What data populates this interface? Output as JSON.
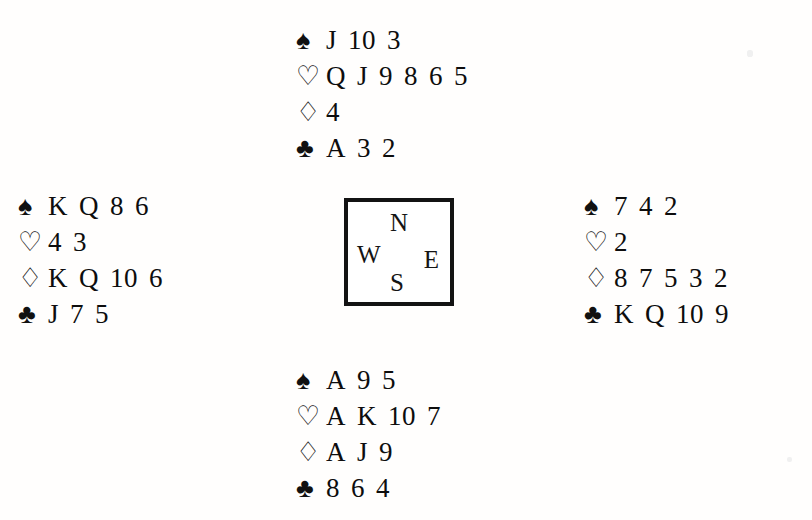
{
  "diagram": {
    "suit_order": [
      "spades",
      "hearts",
      "diamonds",
      "clubs"
    ],
    "symbols": {
      "spades": "♠",
      "hearts": "♡",
      "diamonds": "♢",
      "clubs": "♣"
    },
    "symbol_names": {
      "spades": "spade-suit-icon",
      "hearts": "heart-suit-icon",
      "diamonds": "diamond-suit-icon",
      "clubs": "club-suit-icon"
    },
    "ink_color": "#0d0d0d",
    "background_color": "#fffefd"
  },
  "compass": {
    "north": "N",
    "west": "W",
    "east": "E",
    "south": "S",
    "border_color": "#131313"
  },
  "hands": {
    "north": {
      "position": "North",
      "spades": [
        "J",
        "10",
        "3"
      ],
      "hearts": [
        "Q",
        "J",
        "9",
        "8",
        "6",
        "5"
      ],
      "diamonds": [
        "4"
      ],
      "clubs": [
        "A",
        "3",
        "2"
      ]
    },
    "west": {
      "position": "West",
      "spades": [
        "K",
        "Q",
        "8",
        "6"
      ],
      "hearts": [
        "4",
        "3"
      ],
      "diamonds": [
        "K",
        "Q",
        "10",
        "6"
      ],
      "clubs": [
        "J",
        "7",
        "5"
      ]
    },
    "east": {
      "position": "East",
      "spades": [
        "7",
        "4",
        "2"
      ],
      "hearts": [
        "2"
      ],
      "diamonds": [
        "8",
        "7",
        "5",
        "3",
        "2"
      ],
      "clubs": [
        "K",
        "Q",
        "10",
        "9"
      ]
    },
    "south": {
      "position": "South",
      "spades": [
        "A",
        "9",
        "5"
      ],
      "hearts": [
        "A",
        "K",
        "10",
        "7"
      ],
      "diamonds": [
        "A",
        "J",
        "9"
      ],
      "clubs": [
        "8",
        "6",
        "4"
      ]
    }
  }
}
